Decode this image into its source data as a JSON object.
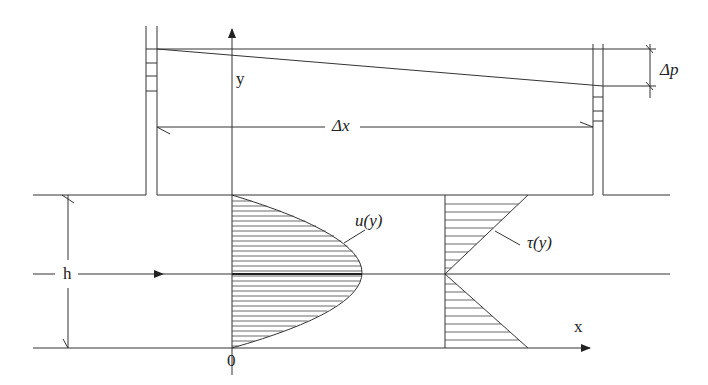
{
  "diagram": {
    "type": "plane Poiseuille flow between parallel plates",
    "labels": {
      "y_axis": "y",
      "x_axis": "x",
      "origin": "0",
      "height": "h",
      "delta_x": "Δx",
      "delta_p": "Δp",
      "velocity_profile": "u(y)",
      "shear_profile": "τ(y)"
    },
    "colors": {
      "line": "#333333",
      "background": "#ffffff"
    }
  }
}
